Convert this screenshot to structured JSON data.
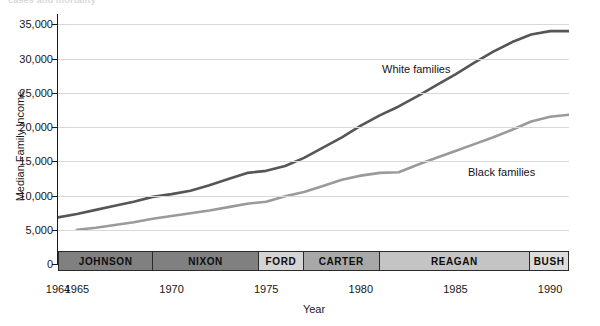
{
  "top_clipped_text": "cases and mortality",
  "chart_data": {
    "type": "line",
    "title": "",
    "xlabel": "Year",
    "ylabel": "Median Family Income",
    "xlim": [
      1964,
      1991
    ],
    "ylim": [
      0,
      36500
    ],
    "grid": true,
    "legend_position": "inline-annotations",
    "ytick_labels": [
      "0",
      "5,000",
      "10,000",
      "15,000",
      "20,000",
      "25,000",
      "30,000",
      "35,000"
    ],
    "ytick_values": [
      0,
      5000,
      10000,
      15000,
      20000,
      25000,
      30000,
      35000
    ],
    "xtick_labels": [
      "1964",
      "1965",
      "1970",
      "1975",
      "1980",
      "1985",
      "1990"
    ],
    "xtick_values": [
      1964,
      1965,
      1970,
      1975,
      1980,
      1985,
      1990
    ],
    "series": [
      {
        "name": "White families",
        "color": "#565656",
        "x": [
          1964,
          1965,
          1966,
          1967,
          1968,
          1969,
          1970,
          1971,
          1972,
          1973,
          1974,
          1975,
          1976,
          1977,
          1978,
          1979,
          1980,
          1981,
          1982,
          1983,
          1984,
          1985,
          1986,
          1987,
          1988,
          1989,
          1990,
          1991
        ],
        "y": [
          6800,
          7300,
          7900,
          8500,
          9100,
          9800,
          10200,
          10700,
          11500,
          12400,
          13300,
          13600,
          14300,
          15500,
          17000,
          18500,
          20200,
          21700,
          23000,
          24500,
          26100,
          27700,
          29400,
          31000,
          32400,
          33500,
          34000,
          34000
        ]
      },
      {
        "name": "Black families",
        "color": "#9a9a9a",
        "x": [
          1965,
          1966,
          1967,
          1968,
          1969,
          1970,
          1971,
          1972,
          1973,
          1974,
          1975,
          1976,
          1977,
          1978,
          1979,
          1980,
          1981,
          1982,
          1983,
          1984,
          1985,
          1986,
          1987,
          1988,
          1989,
          1990,
          1991
        ],
        "y": [
          5000,
          5300,
          5700,
          6100,
          6600,
          7000,
          7400,
          7800,
          8300,
          8800,
          9100,
          9900,
          10500,
          11400,
          12300,
          12900,
          13300,
          13400,
          14500,
          15500,
          16500,
          17500,
          18500,
          19600,
          20800,
          21500,
          21800
        ]
      }
    ],
    "annotations": [
      {
        "text": "White families",
        "x_px": 382,
        "y_px": 63
      },
      {
        "text": "Black families",
        "x_px": 468,
        "y_px": 166
      }
    ]
  },
  "president_band": {
    "segments": [
      {
        "label": "JOHNSON",
        "start": 1964,
        "end": 1969,
        "color": "#808080"
      },
      {
        "label": "NIXON",
        "start": 1969,
        "end": 1974.6,
        "color": "#808080"
      },
      {
        "label": "FORD",
        "start": 1974.6,
        "end": 1977,
        "color": "#d4d4d4"
      },
      {
        "label": "CARTER",
        "start": 1977,
        "end": 1981,
        "color": "#a8a8a8"
      },
      {
        "label": "REAGAN",
        "start": 1981,
        "end": 1989,
        "color": "#c4c4c4"
      },
      {
        "label": "BUSH",
        "start": 1989,
        "end": 1991,
        "color": "#dcdcdc"
      }
    ]
  }
}
